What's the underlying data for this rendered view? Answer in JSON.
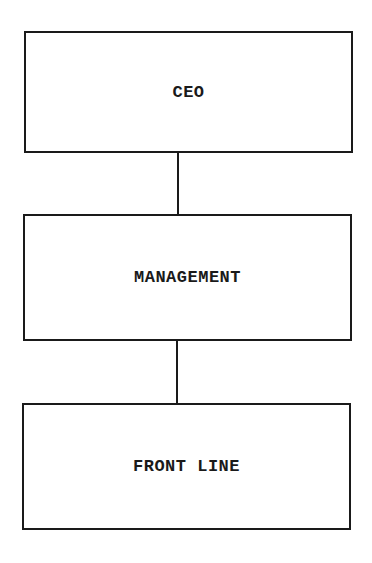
{
  "diagram": {
    "type": "org-hierarchy",
    "nodes": [
      {
        "id": "ceo",
        "label": "CEO"
      },
      {
        "id": "management",
        "label": "MANAGEMENT"
      },
      {
        "id": "front_line",
        "label": "FRONT LINE"
      }
    ],
    "edges": [
      {
        "from": "ceo",
        "to": "management"
      },
      {
        "from": "management",
        "to": "front_line"
      }
    ],
    "colors": {
      "stroke": "#1a1a1a",
      "background": "#ffffff"
    }
  }
}
